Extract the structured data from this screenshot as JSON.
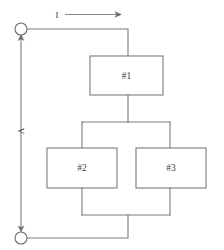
{
  "diagram": {
    "kind": "electrical-circuit-block-diagram",
    "colors": {
      "wire": "#7a7a7a",
      "box_stroke": "#7a7a7a",
      "box_fill": "#ffffff",
      "text": "#3c3c3c",
      "background": "#ffffff"
    },
    "labels": {
      "current": "I",
      "voltage": "V"
    },
    "blocks": [
      {
        "id": "block-1",
        "label": "#1",
        "x": 90,
        "y": 56,
        "width": 73,
        "height": 39
      },
      {
        "id": "block-2",
        "label": "#2",
        "x": 47,
        "y": 148,
        "width": 70,
        "height": 40
      },
      {
        "id": "block-3",
        "label": "#3",
        "x": 136,
        "y": 148,
        "width": 70,
        "height": 40
      }
    ],
    "terminals": [
      {
        "id": "terminal-top",
        "cx": 21,
        "cy": 29,
        "r": 6
      },
      {
        "id": "terminal-bottom",
        "cx": 21,
        "cy": 238,
        "r": 6
      }
    ]
  }
}
